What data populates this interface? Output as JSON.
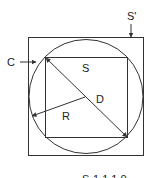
{
  "diagram": {
    "labels": {
      "outer_square": "S'",
      "circle": "C",
      "inner_square": "S",
      "diameter": "D",
      "radius": "R"
    },
    "footer_text_cutoff": "S-1 1 1 0",
    "colors": {
      "stroke": "#333333",
      "background": "#ffffff"
    }
  }
}
